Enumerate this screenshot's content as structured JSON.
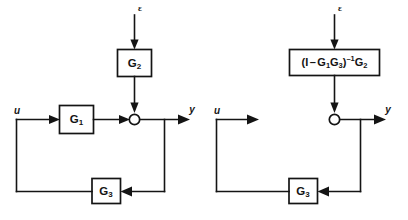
{
  "figure": {
    "background_color": "#ffffff",
    "line_color": "#141414",
    "width": 408,
    "height": 220
  },
  "diagrams": [
    {
      "id": "left",
      "name": "original-feedback-loop",
      "blocks": [
        {
          "id": "g2",
          "label": "G",
          "subscript": "2",
          "superscript": ""
        },
        {
          "id": "g1",
          "label": "G",
          "subscript": "1",
          "superscript": ""
        },
        {
          "id": "g3",
          "label": "G",
          "subscript": "3",
          "superscript": ""
        }
      ],
      "signals": {
        "input": "u",
        "output": "y",
        "disturbance": "ε"
      },
      "junction": {
        "id": "sum",
        "name": "summing-junction"
      }
    },
    {
      "id": "right",
      "name": "reduced-feedback-loop",
      "blocks": [
        {
          "id": "combined",
          "label": "(I − G₁G₃)⁻¹G₂",
          "parts": {
            "open_paren": "(",
            "identity": "I",
            "minus": "–",
            "g1": "G",
            "g1_sub": "1",
            "g3": "G",
            "g3_sub": "3",
            "close_paren": ")",
            "inverse": "–1",
            "g2": "G",
            "g2_sub": "2"
          }
        },
        {
          "id": "g3",
          "label": "G",
          "subscript": "3",
          "superscript": ""
        }
      ],
      "signals": {
        "input": "u",
        "output": "y",
        "disturbance": "ε"
      },
      "junction": {
        "id": "sum",
        "name": "summing-junction"
      }
    }
  ]
}
